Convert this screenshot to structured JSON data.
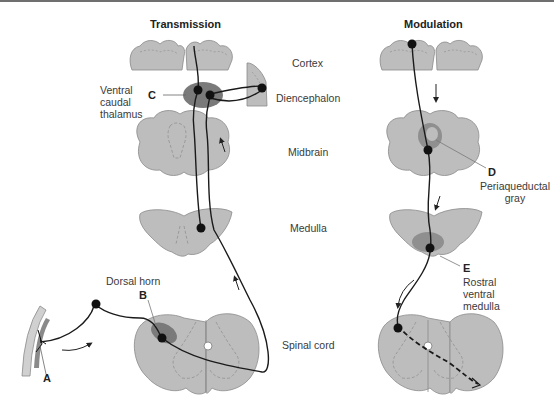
{
  "panels": {
    "left_title": "Transmission",
    "right_title": "Modulation"
  },
  "levels": {
    "cortex": "Cortex",
    "diencephalon": "Diencephalon",
    "midbrain": "Midbrain",
    "medulla": "Medulla",
    "spinal_cord": "Spinal cord"
  },
  "annotations": {
    "A": {
      "letter": "A"
    },
    "B": {
      "letter": "B",
      "label": "Dorsal horn"
    },
    "C": {
      "letter": "C",
      "label_lines": [
        "Ventral",
        "caudal",
        "thalamus"
      ]
    },
    "D": {
      "letter": "D",
      "label_lines": [
        "Periaqueductal",
        "gray"
      ]
    },
    "E": {
      "letter": "E",
      "label_lines": [
        "Rostral",
        "ventral",
        "medulla"
      ]
    }
  },
  "colors": {
    "tissue": "#bdbdbd",
    "tissue_stroke": "#8a8a8a",
    "nucleus": "#7a7a7a",
    "fiber": "#1a1a1a",
    "text": "#3a3a3a"
  }
}
